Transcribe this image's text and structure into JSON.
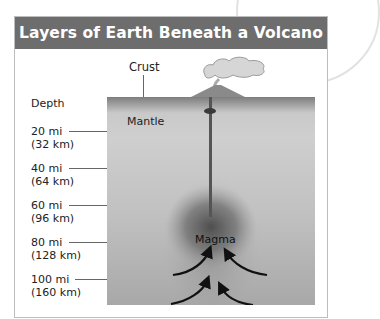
{
  "title": "Layers of Earth Beneath a Volcano",
  "labels": {
    "crust": "Crust",
    "depth": "Depth",
    "mantle": "Mantle",
    "magma": "Magma"
  },
  "depth_markers": [
    {
      "mi": "20 mi",
      "km": "(32 km)"
    },
    {
      "mi": "40 mi",
      "km": "(64 km)"
    },
    {
      "mi": "60 mi",
      "km": "(96 km)"
    },
    {
      "mi": "80 mi",
      "km": "(128 km)"
    },
    {
      "mi": "100 mi",
      "km": "(160 km)"
    }
  ],
  "colors": {
    "header_bg": "#6d6d6d",
    "header_text": "#ffffff",
    "crust": "#7d7d7d",
    "mantle": "#c9c9c9",
    "magma": "#5a5a5a"
  }
}
